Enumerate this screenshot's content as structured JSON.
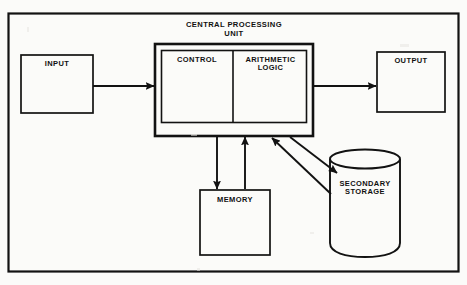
{
  "diagram": {
    "colors": {
      "ink": "#121212",
      "paper": "#fbfbf9"
    },
    "frame": {
      "name": "outer-frame"
    },
    "nodes": {
      "input": {
        "label": "INPUT",
        "shape": "rectangle",
        "x": 21,
        "y": 55,
        "w": 72,
        "h": 58
      },
      "cpu": {
        "title": "CENTRAL PROCESSING\nUNIT",
        "shape": "double-rectangle",
        "x": 155,
        "y": 44,
        "w": 158,
        "h": 92,
        "control": {
          "label": "CONTROL"
        },
        "alu": {
          "label": "ARITHMETIC\nLOGIC"
        }
      },
      "output": {
        "label": "OUTPUT",
        "shape": "rectangle",
        "x": 377,
        "y": 52,
        "w": 68,
        "h": 60
      },
      "memory": {
        "label": "MEMORY",
        "shape": "rectangle",
        "x": 200,
        "y": 190,
        "w": 70,
        "h": 65
      },
      "secondary_storage": {
        "label": "SECONDARY\nSTORAGE",
        "shape": "cylinder",
        "x": 330,
        "y": 150,
        "w": 70,
        "h": 105
      }
    },
    "connections": [
      {
        "name": "input-to-cpu",
        "from": "input",
        "to": "cpu",
        "direction": "one-way",
        "orientation": "horizontal"
      },
      {
        "name": "cpu-to-output",
        "from": "cpu",
        "to": "output",
        "direction": "one-way",
        "orientation": "horizontal"
      },
      {
        "name": "cpu-to-memory",
        "from": "cpu",
        "to": "memory",
        "direction": "one-way",
        "orientation": "vertical-down"
      },
      {
        "name": "memory-to-cpu",
        "from": "memory",
        "to": "cpu",
        "direction": "one-way",
        "orientation": "vertical-up"
      },
      {
        "name": "cpu-to-storage",
        "from": "cpu",
        "to": "secondary_storage",
        "direction": "one-way",
        "orientation": "diagonal-down-right"
      },
      {
        "name": "storage-to-cpu",
        "from": "secondary_storage",
        "to": "cpu",
        "direction": "one-way",
        "orientation": "diagonal-up-left"
      }
    ]
  }
}
